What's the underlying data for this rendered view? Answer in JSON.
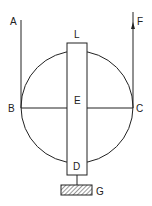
{
  "diagram": {
    "labels": {
      "A": "A",
      "F": "F",
      "L": "L",
      "B": "B",
      "E": "E",
      "C": "C",
      "D": "D",
      "G": "G"
    },
    "colors": {
      "stroke": "#222222",
      "background": "#ffffff"
    }
  }
}
